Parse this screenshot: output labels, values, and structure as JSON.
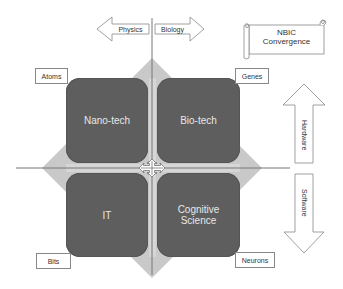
{
  "title": {
    "line1": "NBIC",
    "line2": "Convergence"
  },
  "arrows": {
    "left": "Physics",
    "right": "Biology",
    "up": "Hardware",
    "down": "Software"
  },
  "quadrants": {
    "top_left": "Nano-tech",
    "top_right": "Bio-tech",
    "bottom_left": "IT",
    "bottom_right_line1": "Cognitive",
    "bottom_right_line2": "Science"
  },
  "corner_labels": {
    "top_left": "Atoms",
    "top_right": "Genes",
    "bottom_left": "Bits",
    "bottom_right": "Neurons"
  },
  "colors": {
    "quadrant_fill": "#5e5e5e",
    "diamond_fill": "#c8c8c8",
    "axis_line": "#777777",
    "label_text": "#333333"
  }
}
